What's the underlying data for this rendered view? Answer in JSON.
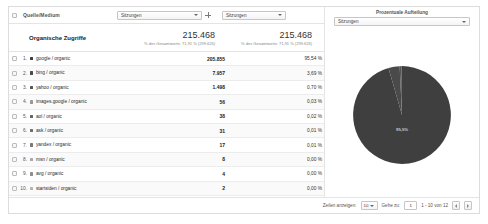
{
  "table": {
    "dimension_header": "Quelle/Medium",
    "metric_select_value": "Sitzungen",
    "pct_select_value": "Sitzungen",
    "add_metric_icon": "plus-icon",
    "totals": {
      "label": "Organische Zugriffe",
      "metric_value": "215.468",
      "metric_sub": "% des Gesamtwerts: 71,91 % (299.626)",
      "pct_value": "215.468",
      "pct_sub": "% des Gesamtwerts: 71,91 % (299.626)"
    },
    "rows": [
      {
        "rank": "1.",
        "label": "google / organic",
        "sessions": "205.855",
        "percent": "95,54 %",
        "color": "#3f3f3f"
      },
      {
        "rank": "2.",
        "label": "bing / organic",
        "sessions": "7.957",
        "percent": "3,69 %",
        "color": "#4a4a4a"
      },
      {
        "rank": "3.",
        "label": "yahoo / organic",
        "sessions": "1.498",
        "percent": "0,70 %",
        "color": "#565656"
      },
      {
        "rank": "4.",
        "label": "images.google / organic",
        "sessions": "56",
        "percent": "0,03 %",
        "color": "#9a9a9a"
      },
      {
        "rank": "5.",
        "label": "aol / organic",
        "sessions": "38",
        "percent": "0,02 %",
        "color": "#636363"
      },
      {
        "rank": "6.",
        "label": "ask / organic",
        "sessions": "31",
        "percent": "0,01 %",
        "color": "#6e6e6e"
      },
      {
        "rank": "7.",
        "label": "yandex / organic",
        "sessions": "17",
        "percent": "0,01 %",
        "color": "#7a7a7a"
      },
      {
        "rank": "8.",
        "label": "msn / organic",
        "sessions": "8",
        "percent": "0,00 %",
        "color": "#a8a8a8"
      },
      {
        "rank": "9.",
        "label": "avg / organic",
        "sessions": "4",
        "percent": "0,00 %",
        "color": "#8f8f8f"
      },
      {
        "rank": "10.",
        "label": "startsiden / organic",
        "sessions": "2",
        "percent": "0,00 %",
        "color": "#b4b4b4"
      }
    ]
  },
  "pie_panel": {
    "title": "Prozentuale Aufteilung",
    "select_value": "Sitzungen"
  },
  "footer": {
    "rows_label": "Zeilen anzeigen:",
    "rows_value": "10",
    "goto_label": "Gehe zu:",
    "goto_value": "1",
    "range_text": "1 - 10 von 12",
    "prev_icon": "chevron-left-icon",
    "next_icon": "chevron-right-icon"
  },
  "chart_data": {
    "type": "pie",
    "title": "Prozentuale Aufteilung",
    "metric": "Sitzungen",
    "legend": "none",
    "labels": [
      "google / organic",
      "bing / organic",
      "yahoo / organic",
      "images.google / organic",
      "aol / organic",
      "ask / organic",
      "yandex / organic",
      "msn / organic",
      "avg / organic",
      "startsiden / organic"
    ],
    "values": [
      205855,
      7957,
      1498,
      56,
      38,
      31,
      17,
      8,
      4,
      2
    ],
    "percentages": [
      95.54,
      3.69,
      0.7,
      0.03,
      0.02,
      0.01,
      0.01,
      0.0,
      0.0,
      0.0
    ],
    "colors": [
      "#3f3f3f",
      "#4a4a4a",
      "#565656",
      "#9a9a9a",
      "#636363",
      "#6e6e6e",
      "#7a7a7a",
      "#a8a8a8",
      "#8f8f8f",
      "#b4b4b4"
    ],
    "annotations": [
      {
        "text": "95,5%",
        "slice": "google / organic"
      }
    ]
  }
}
